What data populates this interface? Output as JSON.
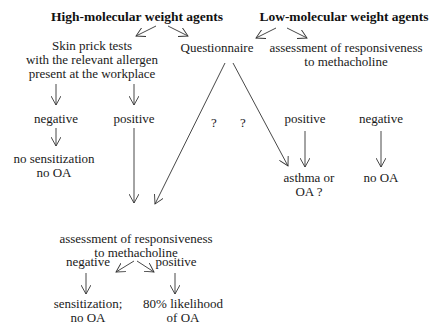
{
  "diagram": {
    "headers": {
      "hmw": "High-molecular weight agents",
      "lmw": "Low-molecular weight agents"
    },
    "skin_prick": {
      "line1": "Skin prick tests",
      "line2": "with the relevant allergen",
      "line3": "present at the workplace"
    },
    "questionnaire": "Questionnaire",
    "lmw_assessment": {
      "line1": "assessment of responsiveness",
      "line2": "to methacholine"
    },
    "skin_results": {
      "negative": "negative",
      "positive": "positive",
      "negative_outcome_line1": "no sensitization",
      "negative_outcome_line2": "no OA"
    },
    "questionnaire_marks": [
      "?",
      "?"
    ],
    "lmw_results": {
      "positive": "positive",
      "negative": "negative",
      "positive_outcome_line1": "asthma or",
      "positive_outcome_line2": "OA ?",
      "negative_outcome": "no OA"
    },
    "hmw_assessment": {
      "line1": "assessment of responsiveness",
      "line2": "to methacholine",
      "negative": "negative",
      "positive": "positive",
      "negative_outcome_line1": "sensitization;",
      "negative_outcome_line2": "no OA",
      "positive_outcome_line1": "80% likelihood",
      "positive_outcome_line2": "of OA"
    }
  }
}
